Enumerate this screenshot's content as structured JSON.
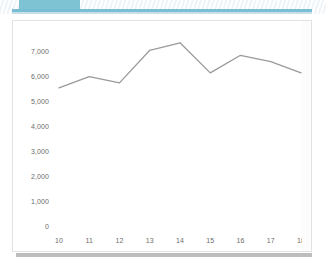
{
  "top_band": {
    "tab_label": "",
    "tab_color": "#7ec3d4",
    "rule_color": "#79bed2"
  },
  "panel": {
    "background": "#ffffff",
    "border_color": "#e2e2e2",
    "scrollbar_thumb_color": "#c4c4c4"
  },
  "chart_data": {
    "type": "line",
    "title": "",
    "subtitle": "",
    "xlabel": "",
    "ylabel": "",
    "categories": [
      "10",
      "11",
      "12",
      "13",
      "14",
      "15",
      "16",
      "17",
      "18"
    ],
    "x": [
      10,
      11,
      12,
      13,
      14,
      15,
      16,
      17,
      18
    ],
    "values": [
      5550,
      6000,
      5750,
      7050,
      7350,
      6150,
      6850,
      6600,
      6150
    ],
    "series": [
      {
        "name": "",
        "values": [
          5550,
          6000,
          5750,
          7050,
          7350,
          6150,
          6850,
          6600,
          6150
        ],
        "color": "#9a9a9a",
        "line_width": 1.3,
        "markers": false
      }
    ],
    "ylim": [
      0,
      7500
    ],
    "xlim": [
      10,
      18
    ],
    "y_ticks": [
      0,
      1000,
      2000,
      3000,
      4000,
      5000,
      6000,
      7000
    ],
    "y_tick_labels": [
      "0",
      "1,000",
      "2,000",
      "3,000",
      "4,000",
      "5,000",
      "6,000",
      "7,000"
    ],
    "x_ticks": [
      10,
      11,
      12,
      13,
      14,
      15,
      16,
      17,
      18
    ],
    "x_tick_labels": [
      "10",
      "11",
      "12",
      "13",
      "14",
      "15",
      "16",
      "17",
      "18"
    ],
    "grid": false,
    "legend": false,
    "legend_position": "none",
    "axis_line_color": "none",
    "tick_label_color": "#6d6d6d",
    "annotations": []
  }
}
